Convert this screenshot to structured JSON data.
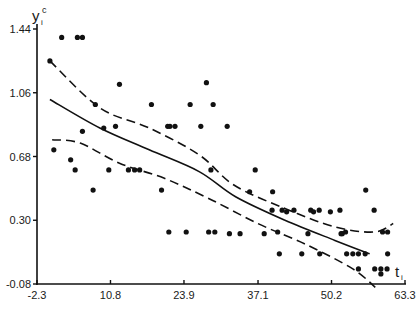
{
  "chart_data": {
    "type": "scatter",
    "title": "",
    "xlabel": "t_i",
    "ylabel": "y_i^c",
    "xlim": [
      -2.3,
      63.3
    ],
    "ylim": [
      -0.08,
      1.44
    ],
    "x_ticks": [
      "-2.3",
      "10.8",
      "23.9",
      "37.1",
      "50.2",
      "63.3"
    ],
    "y_ticks": [
      "1.44",
      "1.06",
      "0.68",
      "0.30",
      "-0.08"
    ],
    "grid": false,
    "legend": null,
    "series": [
      {
        "name": "observations",
        "kind": "scatter",
        "points": [
          [
            0.0,
            1.25
          ],
          [
            2.1,
            1.39
          ],
          [
            4.9,
            1.39
          ],
          [
            5.8,
            1.39
          ],
          [
            8.1,
            0.99
          ],
          [
            9.6,
            0.85
          ],
          [
            12.4,
            1.11
          ],
          [
            11.7,
            0.86
          ],
          [
            5.8,
            0.83
          ],
          [
            0.7,
            0.72
          ],
          [
            3.7,
            0.66
          ],
          [
            4.5,
            0.6
          ],
          [
            7.7,
            0.48
          ],
          [
            10.5,
            0.6
          ],
          [
            14.0,
            0.6
          ],
          [
            15.1,
            0.6
          ],
          [
            16.0,
            0.6
          ],
          [
            19.9,
            0.48
          ],
          [
            18.1,
            0.99
          ],
          [
            21.0,
            0.86
          ],
          [
            21.4,
            0.86
          ],
          [
            22.3,
            0.86
          ],
          [
            25.0,
            0.99
          ],
          [
            27.9,
            1.12
          ],
          [
            29.1,
            0.99
          ],
          [
            26.9,
            0.86
          ],
          [
            31.6,
            0.86
          ],
          [
            28.7,
            0.6
          ],
          [
            36.6,
            0.6
          ],
          [
            35.6,
            0.47
          ],
          [
            39.7,
            0.47
          ],
          [
            39.6,
            0.36
          ],
          [
            41.4,
            0.36
          ],
          [
            43.5,
            0.36
          ],
          [
            46.5,
            0.36
          ],
          [
            48.0,
            0.36
          ],
          [
            51.7,
            0.36
          ],
          [
            42.2,
            0.35
          ],
          [
            47.0,
            0.35
          ],
          [
            50.0,
            0.35
          ],
          [
            52.1,
            0.22
          ],
          [
            51.9,
            0.22
          ],
          [
            40.6,
            0.23
          ],
          [
            46.0,
            0.22
          ],
          [
            24.3,
            0.23
          ],
          [
            28.3,
            0.23
          ],
          [
            29.4,
            0.23
          ],
          [
            21.2,
            0.23
          ],
          [
            32.0,
            0.22
          ],
          [
            33.9,
            0.22
          ],
          [
            38.2,
            0.22
          ],
          [
            40.9,
            0.1
          ],
          [
            44.9,
            0.1
          ],
          [
            48.1,
            0.1
          ],
          [
            52.9,
            0.1
          ],
          [
            54.0,
            0.1
          ],
          [
            55.0,
            0.1
          ],
          [
            56.2,
            0.1
          ],
          [
            60.2,
            0.1
          ],
          [
            60.2,
            0.23
          ],
          [
            57.8,
            0.36
          ],
          [
            59.3,
            0.23
          ],
          [
            56.3,
            0.48
          ],
          [
            59.0,
            -0.02
          ],
          [
            55.0,
            0.01
          ],
          [
            57.9,
            0.01
          ],
          [
            59.0,
            0.01
          ],
          [
            60.1,
            0.01
          ],
          [
            52.7,
            0.23
          ]
        ]
      },
      {
        "name": "fitted curve",
        "kind": "line",
        "style": "solid",
        "points": [
          [
            0.0,
            1.02
          ],
          [
            8.9,
            0.85
          ],
          [
            17.7,
            0.72
          ],
          [
            26.6,
            0.59
          ],
          [
            33.1,
            0.44
          ],
          [
            41.9,
            0.3
          ],
          [
            50.8,
            0.18
          ],
          [
            57.0,
            0.1
          ]
        ]
      },
      {
        "name": "upper confidence band",
        "kind": "line",
        "style": "dashed",
        "points": [
          [
            0.0,
            1.25
          ],
          [
            8.9,
            0.97
          ],
          [
            17.7,
            0.85
          ],
          [
            26.6,
            0.69
          ],
          [
            32.8,
            0.51
          ],
          [
            41.9,
            0.37
          ],
          [
            50.8,
            0.26
          ],
          [
            57.8,
            0.23
          ],
          [
            61.2,
            0.28
          ]
        ]
      },
      {
        "name": "lower confidence band",
        "kind": "line",
        "style": "dashed",
        "points": [
          [
            0.4,
            0.78
          ],
          [
            5.4,
            0.76
          ],
          [
            12.4,
            0.64
          ],
          [
            20.4,
            0.55
          ],
          [
            28.3,
            0.43
          ],
          [
            37.1,
            0.28
          ],
          [
            46.0,
            0.15
          ],
          [
            54.0,
            0.01
          ],
          [
            58.0,
            -0.1
          ]
        ]
      }
    ]
  },
  "axes": {
    "y_label_main": "y",
    "y_label_sup": "c",
    "y_label_sub": "i",
    "x_label_main": "t",
    "x_label_sub": "i",
    "y_ticks": [
      "1.44",
      "1.06",
      "0.68",
      "0.30",
      "-0.08"
    ],
    "x_ticks": [
      "-2.3",
      "10.8",
      "23.9",
      "37.1",
      "50.2",
      "63.3"
    ]
  }
}
